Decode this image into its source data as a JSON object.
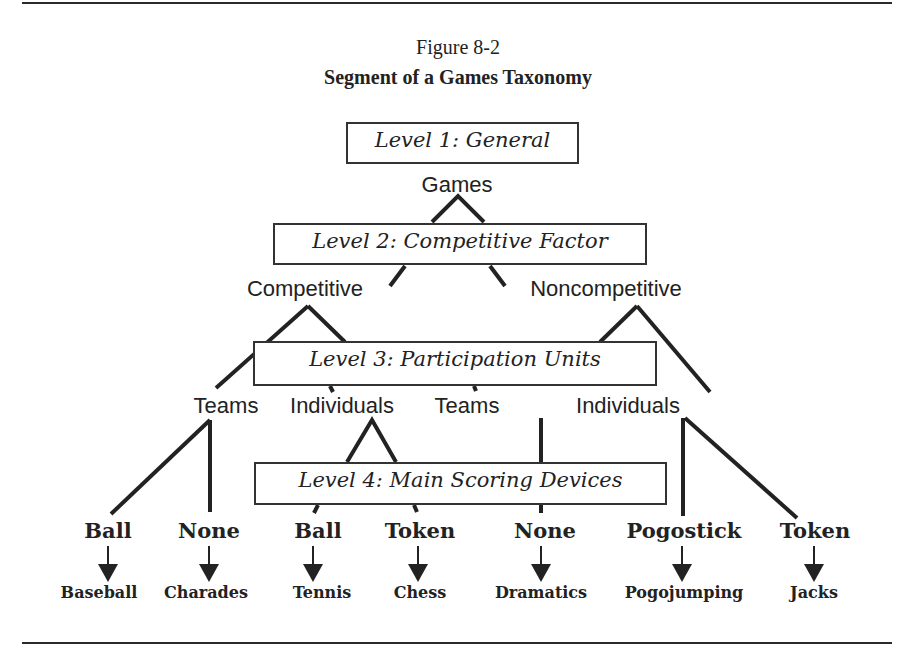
{
  "figure": {
    "number": "Figure 8-2",
    "title": "Segment of a Games Taxonomy"
  },
  "levels": [
    {
      "label": "Level 1: General"
    },
    {
      "label": "Level 2: Competitive Factor"
    },
    {
      "label": "Level 3: Participation Units"
    },
    {
      "label": "Level 4: Main Scoring Devices"
    }
  ],
  "tree": {
    "root": "Games",
    "competitive_factor": [
      "Competitive",
      "Noncompetitive"
    ],
    "participation_units": [
      "Teams",
      "Individuals",
      "Teams",
      "Individuals"
    ],
    "scoring_devices": [
      "Ball",
      "None",
      "Ball",
      "Token",
      "None",
      "Pogostick",
      "Token"
    ],
    "examples": [
      "Baseball",
      "Charades",
      "Tennis",
      "Chess",
      "Dramatics",
      "Pogojumping",
      "Jacks"
    ]
  }
}
